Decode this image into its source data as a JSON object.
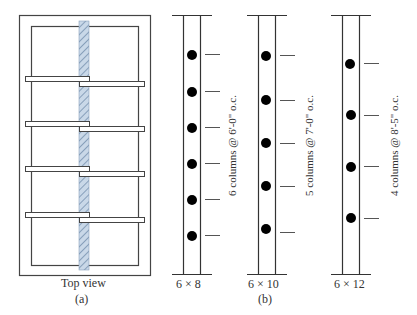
{
  "figure": {
    "part_a": {
      "caption": "Top view",
      "label": "(a)"
    },
    "part_b": {
      "label": "(b)",
      "columns": [
        {
          "size": "6 × 8",
          "note": "6 columns @ 6'-0\" o.c.",
          "count": 6,
          "dots_y": [
            55,
            92,
            128,
            164,
            200,
            236
          ]
        },
        {
          "size": "6 × 10",
          "note": "5 columns @ 7'-0\" o.c.",
          "count": 5,
          "dots_y": [
            56,
            100,
            143,
            186,
            229
          ]
        },
        {
          "size": "6 × 12",
          "note": "4 columns @ 8'-5\" o.c.",
          "count": 4,
          "dots_y": [
            64,
            115,
            167,
            218
          ]
        }
      ]
    },
    "colors": {
      "line": "#333333",
      "hatch_fill": "#c9d8e8",
      "hatch_stroke": "#6b86a6",
      "dot": "#000000"
    }
  }
}
